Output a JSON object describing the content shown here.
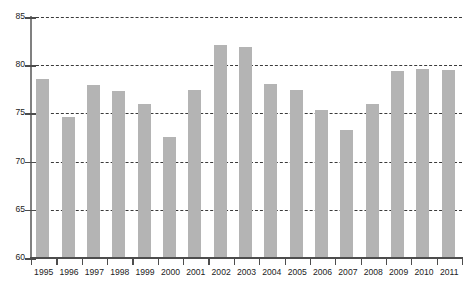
{
  "chart_data": {
    "type": "bar",
    "title": "",
    "subtitle": "",
    "xlabel": "",
    "ylabel": "",
    "categories": [
      "1995",
      "1996",
      "1997",
      "1998",
      "1999",
      "2000",
      "2001",
      "2002",
      "2003",
      "2004",
      "2005",
      "2006",
      "2007",
      "2008",
      "2009",
      "2010",
      "2011"
    ],
    "values": [
      78.6,
      74.6,
      77.9,
      77.3,
      76.0,
      72.6,
      77.4,
      82.1,
      81.9,
      78.1,
      77.4,
      75.4,
      73.3,
      76.0,
      79.4,
      79.6,
      79.5
    ],
    "ylim": [
      60,
      85
    ],
    "yticks": [
      60,
      65,
      70,
      75,
      80,
      85
    ],
    "ytick_labels": [
      "60",
      "65",
      "70",
      "75",
      "80",
      "85"
    ],
    "grid": true,
    "grid_axis": "y",
    "grid_style": "dash-dot",
    "legend": null,
    "legend_position": "none",
    "bar_color": "#b4b4b4",
    "axis_color": "#4d4d4d",
    "gridline_color": "#3b3b3b",
    "background_color": "#ffffff",
    "annotations": []
  }
}
